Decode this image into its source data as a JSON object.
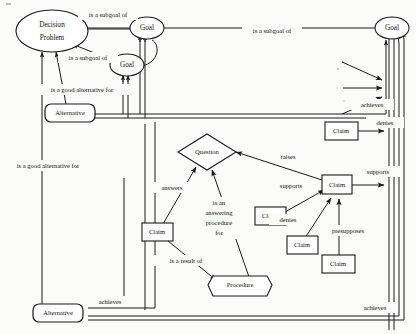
{
  "diagram": {
    "background": "#fbfbf9",
    "ink": "#1a1a1a",
    "nodes": [
      {
        "id": "decision-problem",
        "label": "Decision",
        "label2": "Problem",
        "shape": "ellipse",
        "x": 52,
        "y": 31
      },
      {
        "id": "goal-top",
        "label": "Goal",
        "shape": "ellipse",
        "x": 147,
        "y": 28
      },
      {
        "id": "goal-mid",
        "label": "Goal",
        "shape": "ellipse",
        "x": 127,
        "y": 65
      },
      {
        "id": "goal-right",
        "label": "Goal",
        "shape": "ellipse",
        "x": 392,
        "y": 28
      },
      {
        "id": "alternative-top",
        "label": "Alternative",
        "shape": "rounded-rect",
        "x": 70,
        "y": 113
      },
      {
        "id": "alternative-bottom",
        "label": "Alternative",
        "shape": "rounded-rect",
        "x": 58,
        "y": 313
      },
      {
        "id": "question",
        "label": "Question",
        "shape": "diamond",
        "x": 207,
        "y": 152
      },
      {
        "id": "claim-denies-top",
        "label": "Claim",
        "shape": "rect",
        "x": 343,
        "y": 131
      },
      {
        "id": "claim-main",
        "label": "Claim",
        "shape": "rect",
        "x": 336,
        "y": 185
      },
      {
        "id": "claim-supports",
        "label": "Claim",
        "shape": "rect",
        "x": 271,
        "y": 216
      },
      {
        "id": "claim-denies",
        "label": "Claim",
        "shape": "rect",
        "x": 302,
        "y": 245
      },
      {
        "id": "claim-presupposes",
        "label": "Claim",
        "shape": "rect",
        "x": 337,
        "y": 264
      },
      {
        "id": "claim-answers",
        "label": "Claim",
        "shape": "rect",
        "x": 157,
        "y": 232
      },
      {
        "id": "procedure",
        "label": "Procedure",
        "shape": "hexagon",
        "x": 240,
        "y": 285
      }
    ],
    "edge_labels": [
      {
        "id": "lbl-subgoal-top",
        "text": "is a subgoal of",
        "x": 108,
        "y": 15
      },
      {
        "id": "lbl-subgoal-right",
        "text": "is a subgoal of",
        "x": 272,
        "y": 31
      },
      {
        "id": "lbl-subgoal-mid",
        "text": "is a subgoal of",
        "x": 88,
        "y": 58
      },
      {
        "id": "lbl-good-alt-top",
        "text": "is a good alternative for",
        "x": 82,
        "y": 90
      },
      {
        "id": "lbl-good-alt-left",
        "text": "is a good alternative for",
        "x": 48,
        "y": 166
      },
      {
        "id": "lbl-achieves-right",
        "text": "achieves",
        "x": 372,
        "y": 105
      },
      {
        "id": "lbl-denies-top",
        "text": "denies",
        "x": 385,
        "y": 123
      },
      {
        "id": "lbl-raises",
        "text": "raises",
        "x": 288,
        "y": 157
      },
      {
        "id": "lbl-supports-right",
        "text": "supports",
        "x": 378,
        "y": 172
      },
      {
        "id": "lbl-supports-left",
        "text": "supports",
        "x": 291,
        "y": 186
      },
      {
        "id": "lbl-denies-mid",
        "text": "denies",
        "x": 288,
        "y": 220
      },
      {
        "id": "lbl-presupposes",
        "text": "presupposes",
        "x": 348,
        "y": 231
      },
      {
        "id": "lbl-answers",
        "text": "answers",
        "x": 172,
        "y": 188
      },
      {
        "id": "lbl-is-result-of",
        "text": "is a result of",
        "x": 186,
        "y": 261
      },
      {
        "id": "lbl-answering-1",
        "text": "is an",
        "x": 219,
        "y": 203
      },
      {
        "id": "lbl-answering-2",
        "text": "answering",
        "x": 219,
        "y": 213
      },
      {
        "id": "lbl-answering-3",
        "text": "procedure",
        "x": 219,
        "y": 223
      },
      {
        "id": "lbl-answering-4",
        "text": "for",
        "x": 219,
        "y": 233
      },
      {
        "id": "lbl-achieves-bottom",
        "text": "achieves",
        "x": 110,
        "y": 302
      },
      {
        "id": "lbl-achieves-br",
        "text": "achieves",
        "x": 375,
        "y": 308
      }
    ]
  }
}
